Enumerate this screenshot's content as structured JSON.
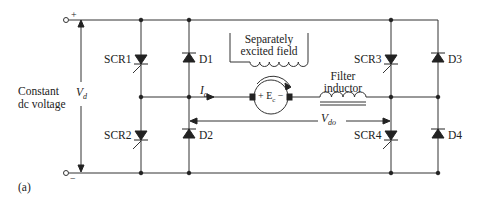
{
  "figure_label": "(a)",
  "source": {
    "label_line1": "Constant",
    "label_line2": "dc voltage",
    "plus": "+",
    "minus": "−",
    "voltage": "V",
    "voltage_sub": "d"
  },
  "devices": {
    "scr1": "SCR1",
    "scr2": "SCR2",
    "scr3": "SCR3",
    "scr4": "SCR4",
    "d1": "D1",
    "d2": "D2",
    "d3": "D3",
    "d4": "D4"
  },
  "field": {
    "line1": "Separately",
    "line2": "excited field"
  },
  "inductor": {
    "line1": "Filter",
    "line2": "inductor"
  },
  "motor": {
    "plus": "+",
    "emf": "E",
    "emf_sub": "c",
    "minus": "−"
  },
  "current": {
    "symbol": "I",
    "sub": "a"
  },
  "output_voltage": {
    "symbol": "V",
    "sub": "do"
  },
  "colors": {
    "line": "#333333",
    "text": "#222222"
  }
}
